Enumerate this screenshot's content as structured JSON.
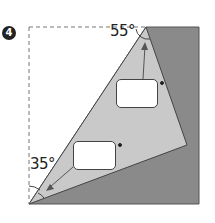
{
  "problem": {
    "number": "4"
  },
  "labels": {
    "top_angle": "55°",
    "bottom_angle": "35°"
  },
  "answer_boxes": [
    {
      "id": "upper",
      "value": "",
      "unit": "°"
    },
    {
      "id": "lower",
      "value": "",
      "unit": "°"
    }
  ],
  "colors": {
    "dark_fill": "#8a8a8a",
    "light_fill": "#c8c8c8",
    "outline": "#444444",
    "dashed": "#777777"
  }
}
